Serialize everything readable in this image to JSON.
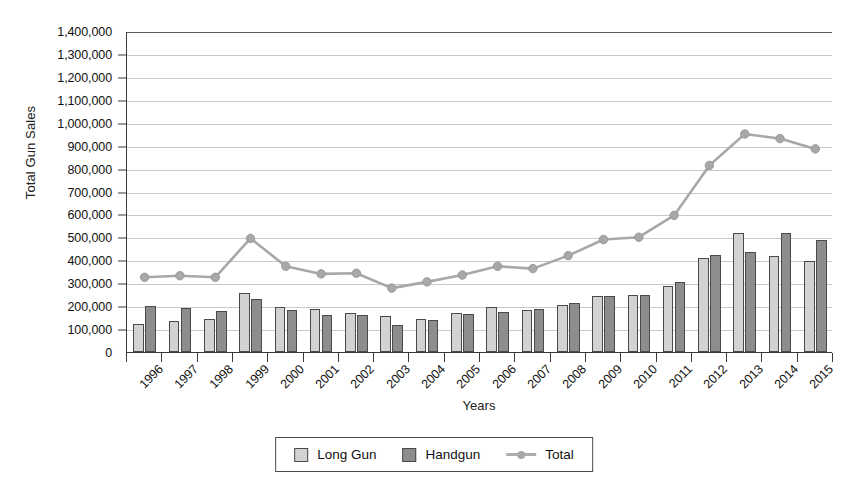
{
  "chart_data": {
    "type": "bar",
    "title": "",
    "xlabel": "Years",
    "ylabel": "Total Gun Sales",
    "ylim": [
      0,
      1400000
    ],
    "ytick_step": 100000,
    "grid": true,
    "legend_position": "bottom",
    "categories": [
      "1996",
      "1997",
      "1998",
      "1999",
      "2000",
      "2001",
      "2002",
      "2003",
      "2004",
      "2005",
      "2006",
      "2007",
      "2008",
      "2009",
      "2010",
      "2011",
      "2012",
      "2013",
      "2014",
      "2015"
    ],
    "ytick_labels": [
      "1,400,000",
      "1,300,000",
      "1,200,000",
      "1,100,000",
      "1,000,000",
      "900,000",
      "800,000",
      "700,000",
      "600,000",
      "500,000",
      "400,000",
      "300,000",
      "200,000",
      "100,000",
      "0"
    ],
    "ytick_values": [
      1400000,
      1300000,
      1200000,
      1100000,
      1000000,
      900000,
      800000,
      700000,
      600000,
      500000,
      400000,
      300000,
      200000,
      100000,
      0
    ],
    "series": [
      {
        "name": "Long Gun",
        "kind": "bar",
        "color": "#d2d2d2",
        "values": [
          122000,
          137000,
          143000,
          258000,
          196000,
          188000,
          168000,
          155000,
          143000,
          168000,
          198000,
          185000,
          203000,
          243000,
          248000,
          290000,
          410000,
          518000,
          418000,
          398000
        ]
      },
      {
        "name": "Handgun",
        "kind": "bar",
        "color": "#8d8d8d",
        "values": [
          200000,
          190000,
          178000,
          233000,
          184000,
          163000,
          160000,
          120000,
          140000,
          165000,
          175000,
          186000,
          215000,
          243000,
          247000,
          305000,
          425000,
          438000,
          518000,
          490000
        ]
      },
      {
        "name": "Total",
        "kind": "line",
        "color": "#a8a8a8",
        "values": [
          330000,
          337000,
          330000,
          500000,
          378000,
          345000,
          348000,
          283000,
          310000,
          340000,
          378000,
          368000,
          425000,
          495000,
          505000,
          600000,
          818000,
          955000,
          935000,
          890000
        ]
      }
    ]
  },
  "legend": {
    "items": [
      {
        "label": "Long Gun",
        "marker": "square-light"
      },
      {
        "label": "Handgun",
        "marker": "square-dark"
      },
      {
        "label": "Total",
        "marker": "line-circle"
      }
    ]
  }
}
